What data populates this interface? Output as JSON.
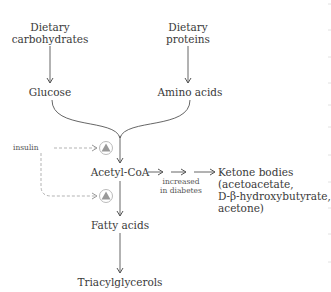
{
  "diagram": {
    "nodes": {
      "dietary_carbohydrates": {
        "line1": "Dietary",
        "line2": "carbohydrates"
      },
      "dietary_proteins": {
        "line1": "Dietary",
        "line2": "proteins"
      },
      "glucose": "Glucose",
      "amino_acids": "Amino acids",
      "acetyl_coa": "Acetyl-CoA",
      "fatty_acids": "Fatty acids",
      "triacylglycerols": "Triacylglycerols",
      "ketone_bodies": {
        "line1": "Ketone bodies",
        "line2": "(acetoacetate,",
        "line3_prefix": "D",
        "line3": "-β-hydroxybutyrate,",
        "line4": "acetone)"
      }
    },
    "regulator": {
      "label": "insulin"
    },
    "annotation": {
      "line1": "increased",
      "line2": "in diabetes"
    },
    "colors": {
      "text": "#3a3a3a",
      "arrow": "#555555",
      "dashed": "#aaaaaa",
      "inhibit_circle": "#bbbbbb",
      "inhibit_triangle": "#999999"
    }
  }
}
